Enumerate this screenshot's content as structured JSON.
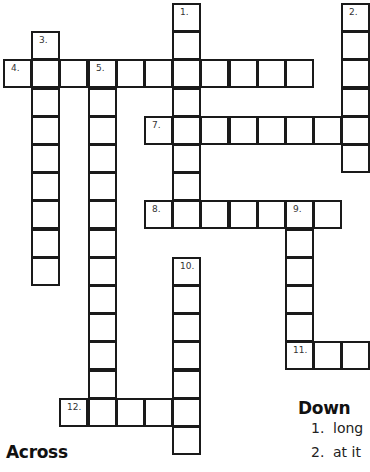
{
  "puzzle": {
    "grid": {
      "cell_size": 28.2,
      "origin_x": 4,
      "origin_y": 4,
      "cells": [
        {
          "r": 0,
          "c": 6,
          "num": "1."
        },
        {
          "r": 1,
          "c": 6
        },
        {
          "r": 2,
          "c": 6
        },
        {
          "r": 3,
          "c": 6
        },
        {
          "r": 4,
          "c": 6
        },
        {
          "r": 5,
          "c": 6
        },
        {
          "r": 6,
          "c": 6
        },
        {
          "r": 7,
          "c": 6
        },
        {
          "r": 0,
          "c": 12,
          "num": "2."
        },
        {
          "r": 1,
          "c": 12
        },
        {
          "r": 2,
          "c": 12
        },
        {
          "r": 3,
          "c": 12
        },
        {
          "r": 4,
          "c": 12
        },
        {
          "r": 5,
          "c": 12
        },
        {
          "r": 1,
          "c": 1,
          "num": "3."
        },
        {
          "r": 3,
          "c": 1
        },
        {
          "r": 4,
          "c": 1
        },
        {
          "r": 5,
          "c": 1
        },
        {
          "r": 6,
          "c": 1
        },
        {
          "r": 7,
          "c": 1
        },
        {
          "r": 8,
          "c": 1
        },
        {
          "r": 9,
          "c": 1
        },
        {
          "r": 2,
          "c": 0,
          "num": "4."
        },
        {
          "r": 2,
          "c": 1
        },
        {
          "r": 2,
          "c": 2
        },
        {
          "r": 2,
          "c": 3,
          "num": "5."
        },
        {
          "r": 2,
          "c": 4
        },
        {
          "r": 2,
          "c": 5
        },
        {
          "r": 2,
          "c": 7
        },
        {
          "r": 2,
          "c": 8
        },
        {
          "r": 2,
          "c": 9
        },
        {
          "r": 2,
          "c": 10
        },
        {
          "r": 3,
          "c": 3
        },
        {
          "r": 4,
          "c": 3
        },
        {
          "r": 5,
          "c": 3
        },
        {
          "r": 6,
          "c": 3
        },
        {
          "r": 7,
          "c": 3
        },
        {
          "r": 8,
          "c": 3
        },
        {
          "r": 9,
          "c": 3
        },
        {
          "r": 10,
          "c": 3
        },
        {
          "r": 11,
          "c": 3
        },
        {
          "r": 12,
          "c": 3
        },
        {
          "r": 13,
          "c": 3
        },
        {
          "r": 14,
          "c": 3
        },
        {
          "r": 4,
          "c": 5,
          "num": "7."
        },
        {
          "r": 4,
          "c": 7
        },
        {
          "r": 4,
          "c": 8
        },
        {
          "r": 4,
          "c": 9
        },
        {
          "r": 4,
          "c": 10
        },
        {
          "r": 4,
          "c": 11
        },
        {
          "r": 7,
          "c": 5,
          "num": "8."
        },
        {
          "r": 7,
          "c": 7
        },
        {
          "r": 7,
          "c": 8
        },
        {
          "r": 7,
          "c": 9
        },
        {
          "r": 7,
          "c": 10,
          "num": "9."
        },
        {
          "r": 7,
          "c": 11
        },
        {
          "r": 8,
          "c": 10
        },
        {
          "r": 9,
          "c": 10
        },
        {
          "r": 10,
          "c": 10
        },
        {
          "r": 11,
          "c": 10
        },
        {
          "r": 12,
          "c": 10,
          "num": "11."
        },
        {
          "r": 12,
          "c": 11
        },
        {
          "r": 12,
          "c": 12
        },
        {
          "r": 9,
          "c": 6,
          "num": "10."
        },
        {
          "r": 10,
          "c": 6
        },
        {
          "r": 11,
          "c": 6
        },
        {
          "r": 12,
          "c": 6
        },
        {
          "r": 13,
          "c": 6
        },
        {
          "r": 14,
          "c": 6
        },
        {
          "r": 15,
          "c": 6
        },
        {
          "r": 14,
          "c": 2,
          "num": "12."
        },
        {
          "r": 14,
          "c": 4
        },
        {
          "r": 14,
          "c": 5
        }
      ]
    },
    "across": {
      "heading": "Across",
      "clues": []
    },
    "down": {
      "heading": "Down",
      "clues": [
        {
          "num": "1.",
          "text": "long"
        },
        {
          "num": "2.",
          "text": "at it"
        }
      ]
    }
  }
}
